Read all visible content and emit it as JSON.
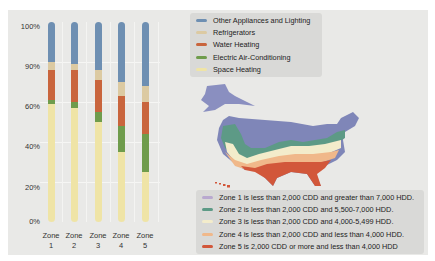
{
  "chart_data": {
    "type": "bar",
    "stacked": true,
    "title": "",
    "xlabel": "",
    "ylabel": "",
    "categories": [
      "Zone 1",
      "Zone 2",
      "Zone 3",
      "Zone 4",
      "Zone 5"
    ],
    "y_tick_labels": [
      "100%",
      "90%",
      "60%",
      "40%",
      "20%",
      "0%"
    ],
    "ylim": [
      0,
      100
    ],
    "grid": true,
    "legend_position": "top-right",
    "series": [
      {
        "name": "Space Heating",
        "color": "#efe4a6",
        "values": [
          59,
          57,
          50,
          35,
          25
        ]
      },
      {
        "name": "Electric Air-Conditioning",
        "color": "#6f9c4c",
        "values": [
          2,
          3,
          5,
          13,
          19
        ]
      },
      {
        "name": "Water Heating",
        "color": "#c9653d",
        "values": [
          15,
          16,
          16,
          15,
          16
        ]
      },
      {
        "name": "Refrigerators",
        "color": "#dccaa2",
        "values": [
          4,
          3,
          5,
          7,
          8
        ]
      },
      {
        "name": "Other Appliances and Lighting",
        "color": "#6e8fb2",
        "values": [
          20,
          21,
          24,
          30,
          32
        ]
      }
    ]
  },
  "axis": {
    "y_ticks": [
      "100%",
      "90%",
      "60%",
      "40%",
      "20%",
      "0%"
    ],
    "x_labels": [
      {
        "top": "Zone",
        "bottom": "1"
      },
      {
        "top": "Zone",
        "bottom": "2"
      },
      {
        "top": "Zone",
        "bottom": "3"
      },
      {
        "top": "Zone",
        "bottom": "4"
      },
      {
        "top": "Zone",
        "bottom": "5"
      }
    ]
  },
  "end_use_legend": [
    {
      "label": "Other Appliances and Lighting",
      "color": "#6e8fb2"
    },
    {
      "label": "Refrigerators",
      "color": "#dccaa2"
    },
    {
      "label": "Water Heating",
      "color": "#c9653d"
    },
    {
      "label": "Electric Air-Conditioning",
      "color": "#6f9c4c"
    },
    {
      "label": "Space Heating",
      "color": "#efe4a6"
    }
  ],
  "zone_legend": [
    {
      "label": "Zone 1 is less than 2,000 CDD and greater than 7,000 HDD.",
      "color": "#b9a9cf"
    },
    {
      "label": "Zone 2 is less than 2,000 CDD and 5,500-7,000 HDD.",
      "color": "#5d9a86"
    },
    {
      "label": "Zone 3 is less than 2,000 CDD and 4,000-5,499 HDD.",
      "color": "#f3eccb"
    },
    {
      "label": "Zone 4 is less than 2,000 CDD and less than 4,000 HDD.",
      "color": "#f0b88a"
    },
    {
      "label": "Zone 5 is 2,000 CDD or more and less than 4,000 HDD",
      "color": "#d2573a"
    }
  ],
  "map": {
    "zone_colors": [
      "#7f86b8",
      "#5d9a86",
      "#f3eccb",
      "#f0b88a",
      "#d2573a"
    ],
    "alaska_color": "#8a8fc0"
  }
}
